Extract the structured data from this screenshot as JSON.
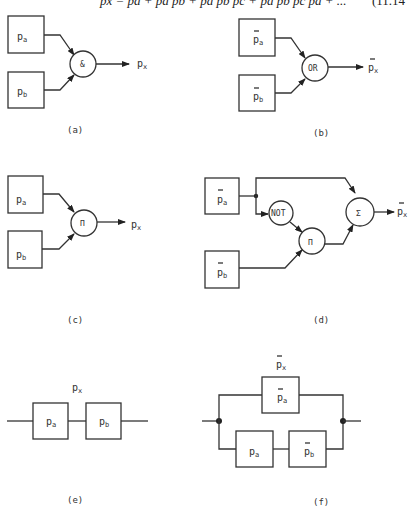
{
  "equation": {
    "text": "px = pa + p̄a pb + p̄a p̄b pc + p̄a p̄b p̄c pd + ...",
    "number": "(11.14"
  },
  "panels": {
    "a": {
      "caption": "(a)",
      "inputs": [
        {
          "base": "p",
          "sub": "a",
          "bar": false
        },
        {
          "base": "p",
          "sub": "b",
          "bar": false
        }
      ],
      "gate": "&",
      "output": {
        "base": "p",
        "sub": "x",
        "bar": false
      }
    },
    "b": {
      "caption": "(b)",
      "inputs": [
        {
          "base": "p",
          "sub": "a",
          "bar": true
        },
        {
          "base": "p",
          "sub": "b",
          "bar": true
        }
      ],
      "gate": "OR",
      "output": {
        "base": "p",
        "sub": "x",
        "bar": true
      }
    },
    "c": {
      "caption": "(c)",
      "inputs": [
        {
          "base": "p",
          "sub": "a",
          "bar": false
        },
        {
          "base": "p",
          "sub": "b",
          "bar": false
        }
      ],
      "gate": "Π",
      "output": {
        "base": "p",
        "sub": "x",
        "bar": false
      }
    },
    "d": {
      "caption": "(d)",
      "inputs": [
        {
          "base": "p",
          "sub": "a",
          "bar": true
        },
        {
          "base": "p",
          "sub": "b",
          "bar": true
        }
      ],
      "gates": [
        "NOT",
        "Π",
        "Σ"
      ],
      "output": {
        "base": "p",
        "sub": "x",
        "bar": true
      }
    },
    "e": {
      "caption": "(e)",
      "label": {
        "base": "p",
        "sub": "x",
        "bar": false
      },
      "blocks": [
        {
          "base": "p",
          "sub": "a",
          "bar": false
        },
        {
          "base": "p",
          "sub": "b",
          "bar": false
        }
      ]
    },
    "f": {
      "caption": "(f)",
      "label": {
        "base": "p",
        "sub": "x",
        "bar": true
      },
      "top_block": {
        "base": "p",
        "sub": "a",
        "bar": true
      },
      "bottom_blocks": [
        {
          "base": "p",
          "sub": "a",
          "bar": false
        },
        {
          "base": "p",
          "sub": "b",
          "bar": true
        }
      ]
    }
  },
  "colors": {
    "ink": "#333333",
    "background": "#ffffff"
  }
}
